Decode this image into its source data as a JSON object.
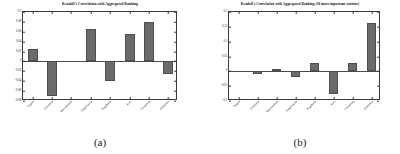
{
  "figure": {
    "subfigures": [
      {
        "caption": "(a)",
        "chart_data": {
          "type": "bar",
          "title": "Kendall's Correlation with Aggregated Ranking",
          "xlabel": "",
          "ylabel": "",
          "ylim": [
            -0.08,
            0.1
          ],
          "yticks": [
            0.1,
            0.08,
            0.06,
            0.04,
            0.02,
            0,
            -0.02,
            -0.04,
            -0.06,
            -0.08
          ],
          "ytick_labels": [
            "0.1",
            "0.08",
            "0.06",
            "0.04",
            "0.02",
            "0",
            "-0.02",
            "-0.04",
            "-0.06",
            "-0.08"
          ],
          "grid": false,
          "legend": "none",
          "bar_color": "#6b6b6b",
          "categories": [
            "Degree",
            "Closeness",
            "Betweenness",
            "Eigenvector",
            "PageRank",
            "Katz",
            "Clustering",
            "Harmonic"
          ],
          "values": [
            0.025,
            -0.07,
            0.0,
            0.065,
            -0.04,
            0.055,
            0.079,
            -0.025
          ]
        }
      },
      {
        "caption": "(b)",
        "chart_data": {
          "type": "bar",
          "title": "Kendall's Correlation with Aggregated Ranking (30 most important stations)",
          "xlabel": "",
          "ylabel": "",
          "ylim": [
            -0.1,
            0.2
          ],
          "yticks": [
            0.2,
            0.15,
            0.1,
            0.05,
            0,
            -0.05,
            -0.1
          ],
          "ytick_labels": [
            "0.2",
            "0.15",
            "0.1",
            "0.05",
            "0",
            "-0.05",
            "-0.1"
          ],
          "grid": false,
          "legend": "none",
          "bar_color": "#6b6b6b",
          "categories": [
            "Degree",
            "Closeness",
            "Betweenness",
            "Eigenvector",
            "PageRank",
            "Katz",
            "Clustering",
            "Harmonic"
          ],
          "values": [
            0.0,
            -0.008,
            0.008,
            -0.02,
            0.028,
            -0.075,
            0.028,
            0.163
          ]
        }
      }
    ]
  }
}
